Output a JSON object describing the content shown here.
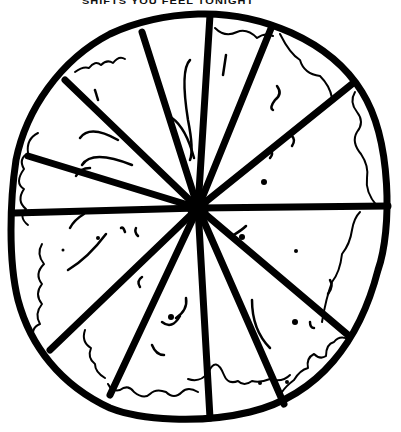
{
  "caption": {
    "text": "SHIFTS YOU FEEL TONIGHT"
  },
  "illustration": {
    "subject": "hand-drawn pizza",
    "style": "black ink line art",
    "slice_count": 12,
    "ink_color": "#000000",
    "background_color": "#ffffff",
    "center": [
      198,
      208
    ]
  }
}
